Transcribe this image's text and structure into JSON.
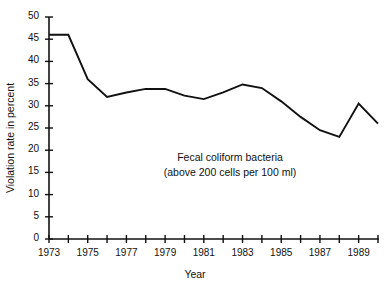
{
  "figure": {
    "top_cut_text": "· · · · · · · · · ·",
    "annotation_line1": "Fecal coliform bacteria",
    "annotation_line2": "(above 200 cells per 100 ml)",
    "line_color": "#111111",
    "axis_color": "#111111",
    "background": "#ffffff"
  },
  "chart_data": {
    "type": "line",
    "title": "",
    "xlabel": "Year",
    "ylabel": "Violation rate in percent",
    "xlim": [
      1973,
      1990
    ],
    "ylim": [
      0,
      50
    ],
    "grid": false,
    "legend": null,
    "annotations": [
      "Fecal coliform bacteria",
      "(above 200 cells per 100 ml)"
    ],
    "yticks": [
      0,
      5,
      10,
      15,
      20,
      25,
      30,
      35,
      40,
      45,
      50
    ],
    "ytick_labels": [
      "0",
      "5",
      "10",
      "15",
      "20",
      "25",
      "30",
      "35",
      "40",
      "45",
      "50"
    ],
    "xticks": [
      1973,
      1974,
      1975,
      1976,
      1977,
      1978,
      1979,
      1980,
      1981,
      1982,
      1983,
      1984,
      1985,
      1986,
      1987,
      1988,
      1989,
      1990
    ],
    "xtick_labels_shown": [
      "1973",
      "1975",
      "1977",
      "1979",
      "1981",
      "1983",
      "1985",
      "1987",
      "1989"
    ],
    "x": [
      1973,
      1974,
      1975,
      1976,
      1977,
      1978,
      1979,
      1980,
      1981,
      1982,
      1983,
      1984,
      1985,
      1986,
      1987,
      1988,
      1989,
      1990
    ],
    "values": [
      46,
      46,
      36,
      32,
      33,
      33.8,
      33.8,
      32.3,
      31.5,
      33,
      34.8,
      34,
      31,
      27.5,
      24.5,
      23,
      30.5,
      26
    ]
  }
}
